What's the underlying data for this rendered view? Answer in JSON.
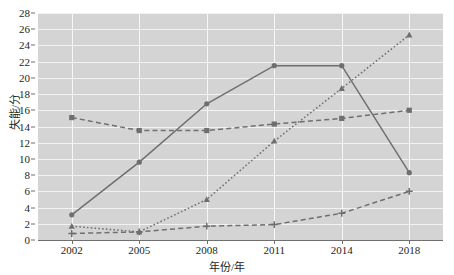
{
  "chart_data": {
    "type": "line",
    "title": "",
    "xlabel": "年份/年",
    "ylabel": "失能/分",
    "categories": [
      "2002",
      "2005",
      "2008",
      "2011",
      "2014",
      "2018"
    ],
    "ylim": [
      0,
      28
    ],
    "ytick_step": 2,
    "yticks": [
      "0",
      "2",
      "4",
      "6",
      "8",
      "10",
      "12",
      "14",
      "16",
      "18",
      "20",
      "22",
      "24",
      "26",
      "28"
    ],
    "grid": true,
    "legend": "none",
    "plot_background": "#d4d4d4",
    "gridline_color": "#f2f2f2",
    "series_color": "#6f6f6f",
    "series": [
      {
        "name": "series-solid-circle",
        "marker": "circle",
        "linestyle": "solid",
        "values": [
          3.1,
          9.6,
          16.8,
          21.5,
          21.5,
          8.3
        ]
      },
      {
        "name": "series-dashed-square",
        "marker": "square",
        "linestyle": "dashed",
        "values": [
          15.1,
          13.5,
          13.5,
          14.3,
          15.0,
          16.0
        ]
      },
      {
        "name": "series-dotted-triangle",
        "marker": "triangle",
        "linestyle": "dotted",
        "values": [
          1.7,
          1.0,
          5.0,
          12.2,
          18.7,
          25.3
        ]
      },
      {
        "name": "series-dashed-plus",
        "marker": "plus",
        "linestyle": "dashed",
        "values": [
          0.8,
          1.0,
          1.7,
          1.9,
          3.3,
          6.0
        ]
      }
    ]
  }
}
